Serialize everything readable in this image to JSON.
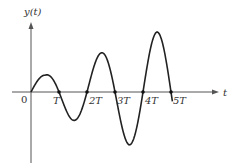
{
  "figure": {
    "y_axis_label": "y(t)",
    "x_axis_label": "t",
    "origin_label": "0",
    "tick_labels": [
      "T",
      "2T",
      "3T",
      "4T",
      "5T"
    ]
  },
  "chart_data": {
    "type": "line",
    "title": "",
    "xlabel": "t",
    "ylabel": "y(t)",
    "x_ticks": [
      "0",
      "T",
      "2T",
      "3T",
      "4T",
      "5T"
    ],
    "zero_crossings_T": [
      0,
      1,
      2,
      3,
      4,
      5
    ],
    "extrema": [
      {
        "t_over_T": 0.5,
        "y_rel": 0.28
      },
      {
        "t_over_T": 1.5,
        "y_rel": -0.47
      },
      {
        "t_over_T": 2.5,
        "y_rel": 0.65
      },
      {
        "t_over_T": 3.5,
        "y_rel": -0.88
      },
      {
        "t_over_T": 4.5,
        "y_rel": 1.0
      }
    ],
    "curve_end_t_over_T": 5.05,
    "grid": false,
    "legend": null
  },
  "layout": {
    "origin_px": [
      31,
      92
    ],
    "T_px": 28,
    "amp_px": 60,
    "x_axis_px": [
      12,
      219
    ],
    "y_axis_px": [
      22,
      163
    ]
  }
}
